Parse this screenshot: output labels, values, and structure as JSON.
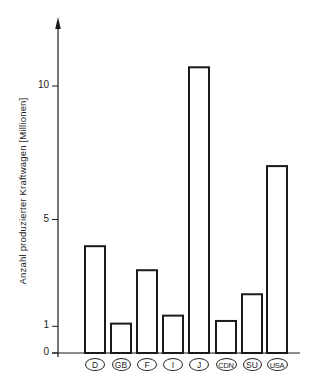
{
  "chart_data": {
    "type": "bar",
    "title": "",
    "xlabel": "",
    "ylabel": "Anzahl produzierter Kraftwagen [Millionen]",
    "categories": [
      "D",
      "GB",
      "F",
      "I",
      "J",
      "CDN",
      "SU",
      "USA"
    ],
    "values": [
      4.0,
      1.1,
      3.1,
      1.4,
      10.7,
      1.2,
      2.2,
      7.0
    ],
    "yticks": [
      0,
      1,
      5,
      10
    ],
    "ytick_labels": [
      "0",
      "1",
      "5",
      "10"
    ],
    "ylim": [
      0,
      12.5
    ],
    "grid": false,
    "legend": null,
    "bar_style": "outline",
    "colors": {
      "stroke": "#1a1a1a",
      "fill": "#ffffff"
    }
  }
}
